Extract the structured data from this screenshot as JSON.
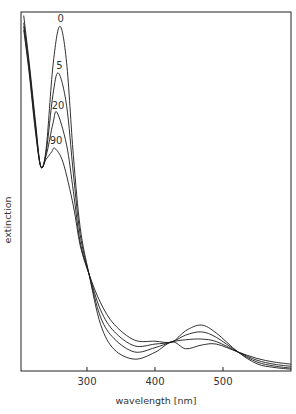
{
  "chart_data": {
    "type": "line",
    "title": "",
    "xlabel": "wavelength [nm]",
    "ylabel": "extinction",
    "xlim": [
      203,
      600
    ],
    "ylim": [
      0,
      1.0
    ],
    "xticks": [
      300,
      400,
      500
    ],
    "yticks": [],
    "grid": false,
    "legend": "inline labels at UV peaks",
    "series": [
      {
        "name": "0",
        "x": [
          207,
          215,
          224,
          232,
          240,
          250,
          260,
          270,
          280,
          290,
          303,
          320,
          340,
          370,
          400,
          425,
          445,
          468,
          490,
          522,
          550,
          575,
          600
        ],
        "values": [
          0.99,
          0.86,
          0.7,
          0.57,
          0.62,
          0.85,
          0.96,
          0.86,
          0.6,
          0.4,
          0.27,
          0.13,
          0.06,
          0.033,
          0.052,
          0.081,
          0.062,
          0.072,
          0.075,
          0.053,
          0.035,
          0.025,
          0.019
        ]
      },
      {
        "name": "5",
        "x": [
          207,
          215,
          224,
          232,
          240,
          250,
          258,
          270,
          280,
          290,
          303,
          320,
          340,
          370,
          400,
          425,
          445,
          468,
          490,
          522,
          550,
          575,
          600
        ],
        "values": [
          0.97,
          0.85,
          0.69,
          0.57,
          0.61,
          0.77,
          0.83,
          0.74,
          0.55,
          0.38,
          0.27,
          0.15,
          0.09,
          0.053,
          0.065,
          0.081,
          0.087,
          0.089,
          0.082,
          0.053,
          0.03,
          0.019,
          0.013
        ]
      },
      {
        "name": "20",
        "x": [
          207,
          215,
          224,
          232,
          240,
          250,
          256,
          270,
          280,
          290,
          303,
          320,
          340,
          370,
          400,
          425,
          445,
          468,
          490,
          522,
          550,
          575,
          600
        ],
        "values": [
          0.96,
          0.84,
          0.68,
          0.57,
          0.6,
          0.69,
          0.72,
          0.63,
          0.5,
          0.36,
          0.27,
          0.17,
          0.11,
          0.07,
          0.075,
          0.081,
          0.1,
          0.109,
          0.094,
          0.053,
          0.025,
          0.014,
          0.008
        ]
      },
      {
        "name": "90",
        "x": [
          207,
          215,
          224,
          232,
          240,
          248,
          253,
          265,
          280,
          290,
          303,
          320,
          340,
          370,
          400,
          425,
          445,
          468,
          490,
          522,
          550,
          575,
          600
        ],
        "values": [
          0.95,
          0.83,
          0.67,
          0.57,
          0.59,
          0.61,
          0.62,
          0.58,
          0.46,
          0.35,
          0.27,
          0.19,
          0.13,
          0.086,
          0.083,
          0.081,
          0.112,
          0.128,
          0.106,
          0.053,
          0.02,
          0.01,
          0.005
        ]
      }
    ],
    "annotations": [
      {
        "text": "0",
        "x": 260,
        "y": 0.96
      },
      {
        "text": "5",
        "x": 258,
        "y": 0.83
      },
      {
        "text": "20",
        "x": 256,
        "y": 0.72
      },
      {
        "text": "90",
        "x": 253,
        "y": 0.62
      }
    ],
    "isosbestic_points_nm": [
      303,
      425,
      522
    ]
  },
  "layout": {
    "plot": {
      "left": 21,
      "top": 12,
      "right": 291,
      "bottom": 371
    },
    "line_color": "#1a1a1a",
    "axis_color": "#222222",
    "text_color": "#333333"
  }
}
